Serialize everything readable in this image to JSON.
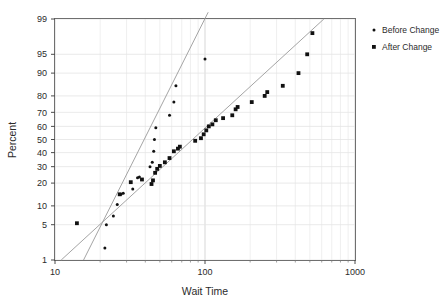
{
  "chart_data": {
    "type": "scatter",
    "title": "",
    "xlabel": "Wait Time",
    "ylabel": "Percent",
    "xscale": "log",
    "yscale": "normal-probability",
    "xlim": [
      10,
      1000
    ],
    "ylim": [
      1,
      99
    ],
    "grid": true,
    "xticks": [
      "10",
      "100",
      "1000"
    ],
    "xtick_values": [
      10,
      100,
      1000
    ],
    "yticks": [
      "1",
      "5",
      "10",
      "20",
      "30",
      "40",
      "50",
      "60",
      "70",
      "80",
      "90",
      "95",
      "99"
    ],
    "ytick_values": [
      1,
      5,
      10,
      20,
      30,
      40,
      50,
      60,
      70,
      80,
      90,
      95,
      99
    ],
    "legend_position": "right",
    "series": [
      {
        "name": "Before Change",
        "marker": "small-dot",
        "color": "#111111",
        "fit_line": {
          "color": "#9a9a9a",
          "x_start": 15.5,
          "y_start": 1.0,
          "x_end": 105,
          "y_end": 99.3
        },
        "points": [
          {
            "x": 21.5,
            "y": 1.8
          },
          {
            "x": 22.0,
            "y": 5.0
          },
          {
            "x": 24.5,
            "y": 7.0
          },
          {
            "x": 26.0,
            "y": 10.5
          },
          {
            "x": 27.5,
            "y": 14.5
          },
          {
            "x": 28.5,
            "y": 15.0
          },
          {
            "x": 33.0,
            "y": 17.0
          },
          {
            "x": 35.5,
            "y": 23.0
          },
          {
            "x": 36.5,
            "y": 23.5
          },
          {
            "x": 43.0,
            "y": 30.0
          },
          {
            "x": 44.5,
            "y": 33.0
          },
          {
            "x": 45.5,
            "y": 41.0
          },
          {
            "x": 46.0,
            "y": 50.0
          },
          {
            "x": 47.0,
            "y": 59.0
          },
          {
            "x": 58.0,
            "y": 68.0
          },
          {
            "x": 62.0,
            "y": 76.5
          },
          {
            "x": 64.0,
            "y": 85.0
          },
          {
            "x": 100.0,
            "y": 94.0
          }
        ]
      },
      {
        "name": "After Change",
        "marker": "square",
        "color": "#111111",
        "fit_line": {
          "color": "#9a9a9a",
          "x_start": 11.0,
          "y_start": 1.0,
          "x_end": 620,
          "y_end": 99.0
        },
        "points": [
          {
            "x": 14.0,
            "y": 5.3
          },
          {
            "x": 27.0,
            "y": 14.5
          },
          {
            "x": 32.0,
            "y": 20.5
          },
          {
            "x": 38.0,
            "y": 22.0
          },
          {
            "x": 44.0,
            "y": 19.5
          },
          {
            "x": 45.0,
            "y": 21.5
          },
          {
            "x": 46.5,
            "y": 26.0
          },
          {
            "x": 48.0,
            "y": 28.5
          },
          {
            "x": 50.0,
            "y": 30.5
          },
          {
            "x": 54.0,
            "y": 33.0
          },
          {
            "x": 58.0,
            "y": 36.0
          },
          {
            "x": 62.0,
            "y": 41.0
          },
          {
            "x": 66.0,
            "y": 43.0
          },
          {
            "x": 68.0,
            "y": 44.5
          },
          {
            "x": 86.0,
            "y": 49.0
          },
          {
            "x": 94.0,
            "y": 51.0
          },
          {
            "x": 98.0,
            "y": 54.0
          },
          {
            "x": 102.0,
            "y": 57.0
          },
          {
            "x": 106.0,
            "y": 60.0
          },
          {
            "x": 112.0,
            "y": 61.5
          },
          {
            "x": 118.0,
            "y": 64.5
          },
          {
            "x": 132.0,
            "y": 66.0
          },
          {
            "x": 152.0,
            "y": 68.0
          },
          {
            "x": 160.0,
            "y": 72.0
          },
          {
            "x": 165.0,
            "y": 73.5
          },
          {
            "x": 205.0,
            "y": 76.5
          },
          {
            "x": 250.0,
            "y": 80.0
          },
          {
            "x": 260.0,
            "y": 82.0
          },
          {
            "x": 330.0,
            "y": 85.0
          },
          {
            "x": 420.0,
            "y": 90.0
          },
          {
            "x": 480.0,
            "y": 95.0
          },
          {
            "x": 520.0,
            "y": 98.0
          }
        ]
      }
    ]
  },
  "legend": {
    "items": [
      {
        "label": "Before Change",
        "marker": "small-dot"
      },
      {
        "label": "After Change",
        "marker": "square"
      }
    ]
  },
  "axes": {
    "x_title": "Wait Time",
    "y_title": "Percent"
  }
}
